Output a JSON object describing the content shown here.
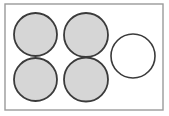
{
  "figure": {
    "name": "cooktop-hob-diagram",
    "canvas": {
      "width": 169,
      "height": 116
    },
    "background_color": "#ffffff"
  },
  "frame": {
    "name": "cooktop-outline",
    "label": "Cooktop panel outline",
    "x": 5.0,
    "y": 4.0,
    "width": 158.0,
    "height": 106.0,
    "fill": "#ffffff",
    "stroke": "#9a9a9a",
    "stroke_width": 1.4
  },
  "style": {
    "filled_fill": "#d6d6d6",
    "filled_stroke": "#3b3b3b",
    "filled_stroke_width": 1.8,
    "empty_fill": "#ffffff",
    "empty_stroke": "#3b3b3b",
    "empty_stroke_width": 1.6
  },
  "burners": [
    {
      "id": "burner-top-left",
      "label": "Top left burner",
      "state": "filled",
      "cx": 35.5,
      "cy": 34.5,
      "r": 21.5,
      "fill": "#d6d6d6",
      "stroke": "#3b3b3b",
      "stroke_width": 1.8
    },
    {
      "id": "burner-top-center",
      "label": "Top center burner",
      "state": "filled",
      "cx": 86.0,
      "cy": 35.0,
      "r": 22.0,
      "fill": "#d6d6d6",
      "stroke": "#3b3b3b",
      "stroke_width": 1.8
    },
    {
      "id": "burner-bottom-left",
      "label": "Bottom left burner",
      "state": "filled",
      "cx": 35.5,
      "cy": 79.5,
      "r": 21.5,
      "fill": "#d6d6d6",
      "stroke": "#3b3b3b",
      "stroke_width": 1.8
    },
    {
      "id": "burner-bottom-center",
      "label": "Bottom center burner",
      "state": "filled",
      "cx": 86.0,
      "cy": 79.5,
      "r": 22.0,
      "fill": "#d6d6d6",
      "stroke": "#3b3b3b",
      "stroke_width": 1.8
    },
    {
      "id": "burner-right-empty",
      "label": "Right burner (unfilled)",
      "state": "empty",
      "cx": 133.0,
      "cy": 56.0,
      "r": 22.0,
      "fill": "#ffffff",
      "stroke": "#3b3b3b",
      "stroke_width": 1.6
    }
  ]
}
